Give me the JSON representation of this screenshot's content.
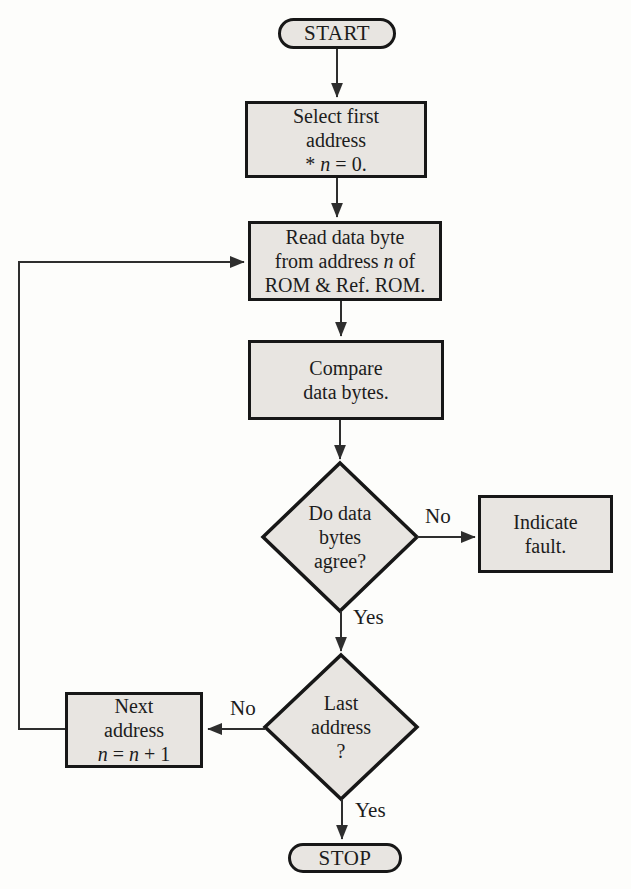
{
  "colors": {
    "background": "#fdfdfb",
    "shape_fill": "#e8e5e1",
    "shape_border": "#171717",
    "line": "#2e2e2e",
    "text": "#1c1c1c"
  },
  "nodes": {
    "start": {
      "label": "START"
    },
    "select_first": {
      "line1": "Select first",
      "line2": "address",
      "line3_pre": "* ",
      "line3_var": "n",
      "line3_post": " = 0."
    },
    "read_data": {
      "line1": "Read data byte",
      "line2_pre": "from address ",
      "line2_var": "n",
      "line2_post": " of",
      "line3": "ROM & Ref. ROM."
    },
    "compare": {
      "line1": "Compare",
      "line2": "data bytes."
    },
    "agree_decision": {
      "line1": "Do data",
      "line2": "bytes",
      "line3": "agree?"
    },
    "indicate_fault": {
      "line1": "Indicate",
      "line2": "fault."
    },
    "last_address_decision": {
      "line1": "Last",
      "line2": "address",
      "line3": "?"
    },
    "next_address": {
      "line1": "Next",
      "line2": "address",
      "line3_var1": "n",
      "line3_mid": " = ",
      "line3_var2": "n",
      "line3_post": " + 1"
    },
    "stop": {
      "label": "STOP"
    }
  },
  "edge_labels": {
    "agree_no": "No",
    "agree_yes": "Yes",
    "last_no": "No",
    "last_yes": "Yes"
  }
}
